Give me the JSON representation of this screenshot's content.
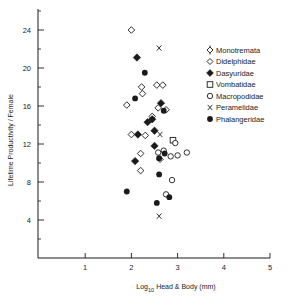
{
  "chart_data": {
    "type": "scatter",
    "title": "",
    "xlabel": "Log10 Head & Body (mm)",
    "xlabel_parts": {
      "prefix": "Log",
      "subscript": "10",
      "suffix": "Head & Body (mm)"
    },
    "ylabel": "Lifetime Productivity / Female",
    "xlim": [
      0,
      5
    ],
    "ylim": [
      0,
      26
    ],
    "x_ticks": [
      1,
      2,
      3,
      4,
      5
    ],
    "y_ticks": [
      4,
      8,
      12,
      16,
      20,
      24
    ],
    "y_minor_ticks": [
      2,
      6,
      10,
      14,
      18,
      22,
      26
    ],
    "grid": false,
    "legend_position": "upper right",
    "legend": [
      {
        "name": "Monotremata",
        "marker": "diamond-open-stem"
      },
      {
        "name": "Didelphidae",
        "marker": "diamond-open"
      },
      {
        "name": "Dasyuridae",
        "marker": "diamond-filled"
      },
      {
        "name": "Vombatidae",
        "marker": "square-open"
      },
      {
        "name": "Macropodidae",
        "marker": "circle-open"
      },
      {
        "name": "Peramelidae",
        "marker": "x"
      },
      {
        "name": "Phalangeridae",
        "marker": "circle-filled"
      }
    ],
    "series": [
      {
        "name": "Monotremata",
        "marker": "diamond-open-stem",
        "points": []
      },
      {
        "name": "Didelphidae",
        "marker": "diamond-open",
        "points": [
          [
            2.0,
            24.0
          ],
          [
            2.22,
            18.0
          ],
          [
            2.24,
            17.3
          ],
          [
            1.9,
            16.1
          ],
          [
            2.55,
            18.2
          ],
          [
            2.68,
            18.2
          ],
          [
            2.0,
            13.0
          ],
          [
            2.58,
            15.8
          ],
          [
            2.75,
            15.6
          ],
          [
            2.45,
            14.9
          ],
          [
            2.2,
            11.0
          ],
          [
            2.62,
            10.4
          ],
          [
            2.3,
            12.9
          ],
          [
            2.2,
            9.2
          ]
        ]
      },
      {
        "name": "Dasyuridae",
        "marker": "diamond-filled",
        "points": [
          [
            2.12,
            21.1
          ],
          [
            2.64,
            16.3
          ],
          [
            2.35,
            14.3
          ],
          [
            2.45,
            14.6
          ],
          [
            2.14,
            13.0
          ],
          [
            2.5,
            13.4
          ],
          [
            2.5,
            11.8
          ],
          [
            2.08,
            10.2
          ]
        ]
      },
      {
        "name": "Vombatidae",
        "marker": "square-open",
        "points": [
          [
            2.9,
            12.4
          ]
        ]
      },
      {
        "name": "Macropodidae",
        "marker": "circle-open",
        "points": [
          [
            2.95,
            12.1
          ],
          [
            2.58,
            11.1
          ],
          [
            2.7,
            11.3
          ],
          [
            2.85,
            10.7
          ],
          [
            3.0,
            10.8
          ],
          [
            3.2,
            11.1
          ],
          [
            2.88,
            8.2
          ],
          [
            2.75,
            6.7
          ]
        ]
      },
      {
        "name": "Peramelidae",
        "marker": "x",
        "points": [
          [
            2.6,
            22.1
          ],
          [
            2.62,
            13.0
          ],
          [
            2.6,
            4.4
          ]
        ]
      },
      {
        "name": "Phalangeridae",
        "marker": "circle-filled",
        "points": [
          [
            2.29,
            19.5
          ],
          [
            2.08,
            16.8
          ],
          [
            2.7,
            15.5
          ],
          [
            2.6,
            10.5
          ],
          [
            2.72,
            11.0
          ],
          [
            2.6,
            8.8
          ],
          [
            2.82,
            6.4
          ],
          [
            2.55,
            5.8
          ],
          [
            1.9,
            7.0
          ]
        ]
      }
    ]
  }
}
